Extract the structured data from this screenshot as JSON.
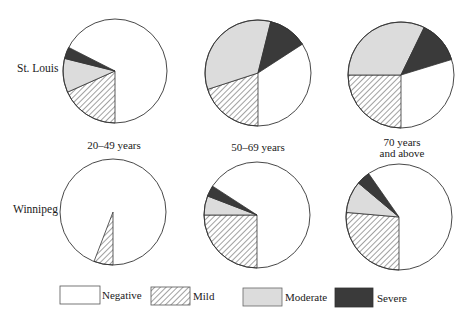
{
  "chart_data": {
    "type": "pie",
    "title": "",
    "rows": [
      "St. Louis",
      "Winnipeg"
    ],
    "columns": [
      "20–49 years",
      "50–69 years",
      "70 years and above"
    ],
    "categories": [
      "Negative",
      "Mild",
      "Moderate",
      "Severe"
    ],
    "colors": {
      "Negative": "#ffffff",
      "Mild": "hatched",
      "Moderate": "#dcdcdc",
      "Severe": "#3a3a3a"
    },
    "pies": [
      {
        "city": "St. Louis",
        "age": "20–49 years",
        "values": {
          "Negative": 68,
          "Mild": 18,
          "Moderate": 10.5,
          "Severe": 3.5
        },
        "angles": {
          "Negative": [
            297,
            540
          ],
          "Mild": [
            180,
            246
          ],
          "Moderate": [
            246,
            284
          ],
          "Severe": [
            284,
            297
          ]
        },
        "cx": 115,
        "cy": 71,
        "r": 52
      },
      {
        "city": "St. Louis",
        "age": "50–69 years",
        "values": {
          "Negative": 34,
          "Mild": 20,
          "Moderate": 34,
          "Severe": 12
        },
        "angles": {
          "Negative": [
            57,
            180
          ],
          "Mild": [
            180,
            252
          ],
          "Moderate": [
            252,
            374
          ],
          "Severe": [
            14,
            57
          ]
        },
        "cx": 258,
        "cy": 73,
        "r": 53
      },
      {
        "city": "St. Louis",
        "age": "70 years and above",
        "values": {
          "Negative": 30,
          "Mild": 25,
          "Moderate": 32,
          "Severe": 13
        },
        "angles": {
          "Negative": [
            73,
            180
          ],
          "Mild": [
            180,
            270
          ],
          "Moderate": [
            270,
            386
          ],
          "Severe": [
            26,
            73
          ]
        },
        "cx": 401,
        "cy": 75,
        "r": 53
      },
      {
        "city": "Winnipeg",
        "age": "20–49 years",
        "values": {
          "Negative": 94,
          "Mild": 6,
          "Moderate": 0,
          "Severe": 0
        },
        "angles": {
          "Negative": [
            201,
            540
          ],
          "Mild": [
            180,
            201
          ]
        },
        "cx": 113,
        "cy": 212,
        "r": 53
      },
      {
        "city": "Winnipeg",
        "age": "50–69 years",
        "values": {
          "Negative": 66,
          "Mild": 25,
          "Moderate": 6,
          "Severe": 3
        },
        "angles": {
          "Negative": [
            303,
            540
          ],
          "Mild": [
            180,
            270
          ],
          "Moderate": [
            270,
            291
          ],
          "Severe": [
            291,
            303
          ]
        },
        "cx": 257,
        "cy": 215,
        "r": 53
      },
      {
        "city": "Winnipeg",
        "age": "70 years and above",
        "values": {
          "Negative": 60,
          "Mild": 26,
          "Moderate": 10,
          "Severe": 4
        },
        "angles": {
          "Negative": [
            325,
            540
          ],
          "Mild": [
            180,
            275
          ],
          "Moderate": [
            275,
            310
          ],
          "Severe": [
            310,
            325
          ]
        },
        "cx": 399,
        "cy": 217,
        "r": 53
      }
    ],
    "legend_position": "bottom"
  },
  "labels": {
    "rows": {
      "st_louis": "St. Louis",
      "winnipeg": "Winnipeg"
    },
    "ages": {
      "a1": "20–49 years",
      "a2": "50–69 years",
      "a3_line1": "70 years",
      "a3_line2": "and above"
    }
  },
  "legend": {
    "negative": "Negative",
    "mild": "Mild",
    "moderate": "Moderate",
    "severe": "Severe"
  }
}
